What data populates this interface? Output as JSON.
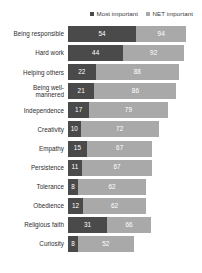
{
  "legend": {
    "items": [
      {
        "label": "Most important",
        "color": "#4a4a4a",
        "icon": "square-marker-icon"
      },
      {
        "label": "NET important",
        "color": "#a9a9a9",
        "icon": "square-marker-icon"
      }
    ]
  },
  "chart_data": {
    "type": "bar",
    "orientation": "horizontal",
    "stacked": true,
    "title": "",
    "subtitle": "",
    "xlabel": "",
    "ylabel": "",
    "xlim": [
      0,
      100
    ],
    "grid": false,
    "legend_position": "top-right",
    "categories": [
      "Being responsible",
      "Hard work",
      "Helping others",
      "Being well-mannered",
      "Independence",
      "Creativity",
      "Empathy",
      "Persistence",
      "Tolerance",
      "Obedience",
      "Religious faith",
      "Curiosity"
    ],
    "series": [
      {
        "name": "Most important",
        "color": "#4a4a4a",
        "values": [
          54,
          44,
          22,
          21,
          17,
          10,
          15,
          11,
          8,
          12,
          31,
          8
        ]
      },
      {
        "name": "NET important",
        "color": "#a9a9a9",
        "values": [
          94,
          92,
          88,
          86,
          79,
          72,
          67,
          67,
          62,
          62,
          66,
          52
        ]
      }
    ]
  },
  "rows": [
    {
      "label_line1": "Being responsible",
      "label_line2": "",
      "most": 54,
      "net": 94
    },
    {
      "label_line1": "Hard work",
      "label_line2": "",
      "most": 44,
      "net": 92
    },
    {
      "label_line1": "Helping others",
      "label_line2": "",
      "most": 22,
      "net": 88
    },
    {
      "label_line1": "Being well-",
      "label_line2": "mannered",
      "most": 21,
      "net": 86
    },
    {
      "label_line1": "Independence",
      "label_line2": "",
      "most": 17,
      "net": 79
    },
    {
      "label_line1": "Creativity",
      "label_line2": "",
      "most": 10,
      "net": 72
    },
    {
      "label_line1": "Empathy",
      "label_line2": "",
      "most": 15,
      "net": 67
    },
    {
      "label_line1": "Persistence",
      "label_line2": "",
      "most": 11,
      "net": 67
    },
    {
      "label_line1": "Tolerance",
      "label_line2": "",
      "most": 8,
      "net": 62
    },
    {
      "label_line1": "Obedience",
      "label_line2": "",
      "most": 12,
      "net": 62
    },
    {
      "label_line1": "Religious faith",
      "label_line2": "",
      "most": 31,
      "net": 66
    },
    {
      "label_line1": "Curiosity",
      "label_line2": "",
      "most": 8,
      "net": 52
    }
  ],
  "scale": {
    "max": 100,
    "pixels_per_unit": 1.26
  }
}
